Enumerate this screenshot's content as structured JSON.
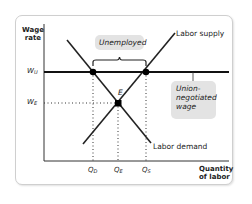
{
  "diagram": {
    "type": "labor-market-union-wage",
    "y_axis_label": [
      "Wage",
      "rate"
    ],
    "x_axis_label": [
      "Quantity",
      "of labor"
    ],
    "y_ticks": [
      {
        "main": "W",
        "sub": "U"
      },
      {
        "main": "W",
        "sub": "E"
      }
    ],
    "x_ticks": [
      {
        "main": "Q",
        "sub": "D"
      },
      {
        "main": "Q",
        "sub": "E"
      },
      {
        "main": "Q",
        "sub": "S"
      }
    ],
    "curves": {
      "supply_label": "Labor supply",
      "demand_label": "Labor demand"
    },
    "equilibrium_label": "E",
    "annotations": {
      "unemployed": "Unemployed",
      "union_wage": [
        "Union-",
        "negotiated",
        "wage"
      ]
    },
    "colors": {
      "line": "#111111",
      "note_bg": "#e3e3e3",
      "frame": "#cfcfcf"
    }
  }
}
